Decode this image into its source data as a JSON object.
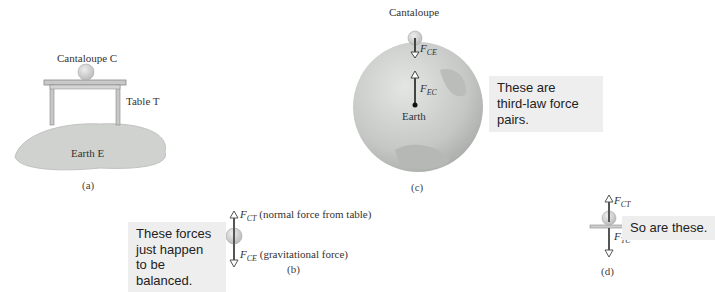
{
  "figure": {
    "panel_a": {
      "cantaloupe_label": "Cantaloupe C",
      "table_label": "Table T",
      "earth_label": "Earth E",
      "caption": "(a)"
    },
    "panel_b": {
      "note": [
        "These forces",
        "just happen",
        "to be balanced."
      ],
      "force_up": {
        "symbol": "F",
        "sub": "CT",
        "desc": "(normal force from table)"
      },
      "force_down": {
        "symbol": "F",
        "sub": "CE",
        "desc": "(gravitational force)"
      },
      "caption": "(b)"
    },
    "panel_c": {
      "cantaloupe_label": "Cantaloupe",
      "force_down": {
        "symbol": "F",
        "sub": "CE"
      },
      "force_up": {
        "symbol": "F",
        "sub": "EC"
      },
      "earth_label": "Earth",
      "note": [
        "These are",
        "third-law force",
        "pairs."
      ],
      "caption": "(c)"
    },
    "panel_d": {
      "force_up": {
        "symbol": "F",
        "sub": "CT"
      },
      "force_down": {
        "symbol": "F",
        "sub": "TC"
      },
      "note": "So are these.",
      "caption": "(d)"
    },
    "colors": {
      "earth": "#c9ccc9",
      "earth_dark": "#a9aca9",
      "table": "#bdbdbd",
      "arrow": "#555555",
      "note_bg": "#eeeeee"
    }
  }
}
